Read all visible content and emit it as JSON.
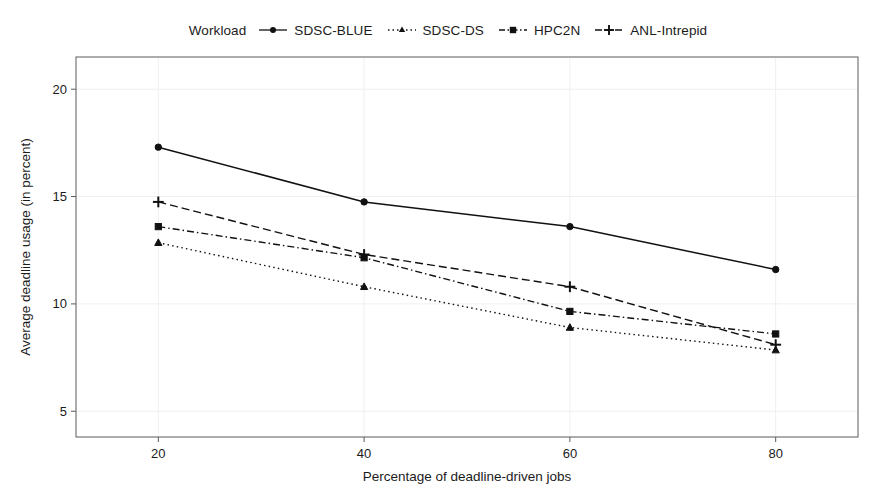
{
  "legend": {
    "title": "Workload",
    "entries": [
      {
        "label": "SDSC-BLUE",
        "marker": "circle-marker",
        "dash": "solid"
      },
      {
        "label": "SDSC-DS",
        "marker": "triangle-marker",
        "dash": "dotted"
      },
      {
        "label": "HPC2N",
        "marker": "square-marker",
        "dash": "dash-dot"
      },
      {
        "label": "ANL-Intrepid",
        "marker": "plus-marker",
        "dash": "dashed"
      }
    ]
  },
  "chart_data": {
    "type": "line",
    "title": "",
    "xlabel": "Percentage of deadline-driven jobs",
    "ylabel": "Average deadline usage (in percent)",
    "x": [
      20,
      40,
      60,
      80
    ],
    "xticks": [
      "20",
      "40",
      "60",
      "80"
    ],
    "yticks": [
      "5",
      "10",
      "15",
      "20"
    ],
    "ytick_values": [
      5,
      10,
      15,
      20
    ],
    "xlim": [
      12,
      88
    ],
    "ylim": [
      3.8,
      21.5
    ],
    "grid": false,
    "legend_position": "top-center",
    "series": [
      {
        "name": "SDSC-BLUE",
        "values": [
          17.3,
          14.75,
          13.6,
          11.6
        ],
        "marker": "circle",
        "dash": "solid"
      },
      {
        "name": "SDSC-DS",
        "values": [
          12.85,
          10.8,
          8.9,
          7.85
        ],
        "marker": "triangle",
        "dash": "dotted"
      },
      {
        "name": "HPC2N",
        "values": [
          13.6,
          12.15,
          9.65,
          8.6
        ],
        "marker": "square",
        "dash": "dash-dot"
      },
      {
        "name": "ANL-Intrepid",
        "values": [
          14.75,
          12.3,
          10.8,
          8.1
        ],
        "marker": "plus",
        "dash": "dashed"
      }
    ]
  }
}
